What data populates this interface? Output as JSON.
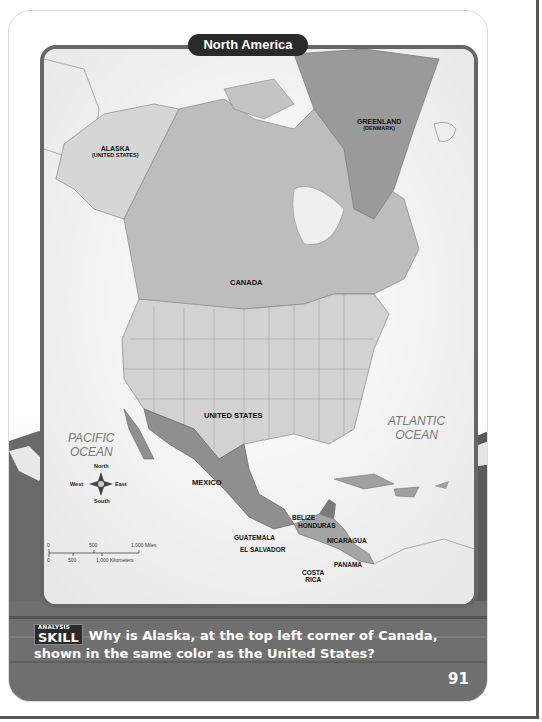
{
  "map": {
    "title": "North America",
    "labels": {
      "alaska": "ALASKA",
      "alaska_sub": "(UNITED STATES)",
      "greenland": "GREENLAND",
      "greenland_sub": "(DENMARK)",
      "canada": "CANADA",
      "united_states": "UNITED STATES",
      "mexico": "MEXICO",
      "belize": "BELIZE",
      "honduras": "HONDURAS",
      "guatemala": "GUATEMALA",
      "nicaragua": "NICARAGUA",
      "el_salvador": "EL SALVADOR",
      "panama": "PANAMA",
      "costa_rica_1": "COSTA",
      "costa_rica_2": "RICA"
    },
    "oceans": {
      "pacific_1": "PACIFIC",
      "pacific_2": "OCEAN",
      "atlantic_1": "ATLANTIC",
      "atlantic_2": "OCEAN"
    },
    "compass": {
      "north": "North",
      "south": "South",
      "east": "East",
      "west": "West"
    },
    "scale": {
      "miles_0": "0",
      "miles_mid": "500",
      "miles_max": "1,000 Miles",
      "km_0": "0",
      "km_mid": "500",
      "km_max": "1,000 Kilometers"
    }
  },
  "question": {
    "badge_top": "ANALYSIS",
    "badge_main": "SKILL",
    "text": "Why is Alaska, at the top left corner of Canada, shown in the same color as the United States?"
  },
  "page_number": "91",
  "colors": {
    "us_fill": "#c9c9c9",
    "canada_fill": "#bdbdbd",
    "mexico_fill": "#8f8f8f",
    "greenland_fill": "#9a9a9a",
    "map_border": "#666666",
    "title_bg": "#2a2a2a"
  }
}
